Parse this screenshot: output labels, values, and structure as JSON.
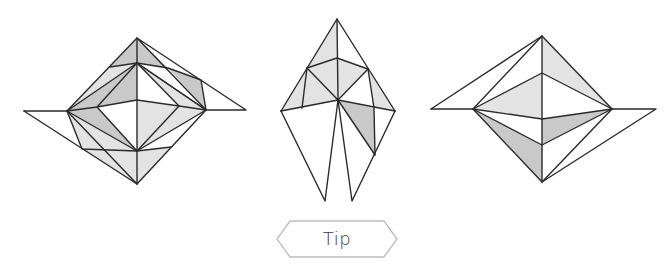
{
  "figures": [
    {
      "id": "fold-step-1",
      "description": "origami diamond with flaps extended left and right"
    },
    {
      "id": "fold-step-2",
      "description": "origami kite shape with two legs pointing down"
    },
    {
      "id": "fold-step-3",
      "description": "origami diamond with flaps extended left and right, lower flap angled"
    }
  ],
  "colors": {
    "line": "#2a2a2a",
    "shade_light": "#e3e3e3",
    "shade_mid": "#c9c9c9",
    "shade_dark": "#b9b9b9",
    "button_border": "#bdbdbd",
    "button_text": "#3a3a3a"
  },
  "tip_button": {
    "label": "Tip",
    "shape": "hexagon"
  }
}
